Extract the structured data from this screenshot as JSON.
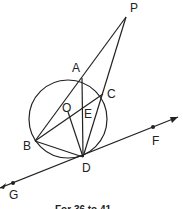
{
  "diagram": {
    "points": {
      "P": "P",
      "A": "A",
      "C": "C",
      "O": "O",
      "E": "E",
      "B": "B",
      "D": "D",
      "F": "F",
      "G": "G"
    },
    "caption": "For 36 to 41"
  }
}
